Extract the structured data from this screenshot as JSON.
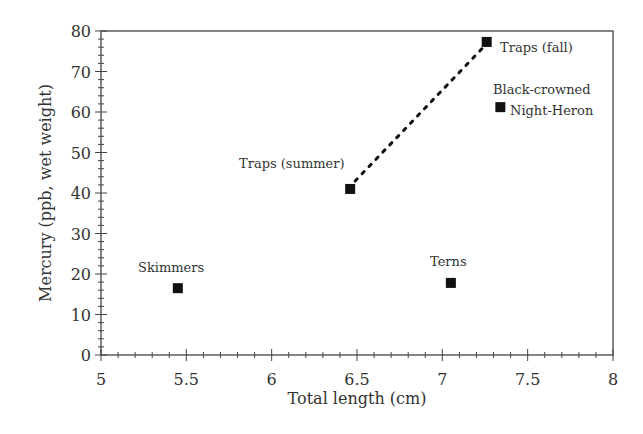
{
  "chart_data": {
    "type": "scatter",
    "title": "",
    "xlabel": "Total length (cm)",
    "ylabel": "Mercury (ppb, wet weight)",
    "xlim": [
      5,
      8
    ],
    "ylim": [
      0,
      80
    ],
    "x_ticks": [
      "5",
      "5.5",
      "6",
      "6.5",
      "7",
      "7.5",
      "8"
    ],
    "y_ticks": [
      "0",
      "10",
      "20",
      "30",
      "40",
      "50",
      "60",
      "70",
      "80"
    ],
    "grid": false,
    "legend": "none",
    "points": [
      {
        "label": "Skimmers",
        "x": 5.45,
        "y": 16.5
      },
      {
        "label": "Traps (summer)",
        "x": 6.46,
        "y": 41
      },
      {
        "label": "Terns",
        "x": 7.05,
        "y": 17.8
      },
      {
        "label": "Traps (fall)",
        "x": 7.26,
        "y": 77.3
      },
      {
        "label": "Black-crowned Night-Heron",
        "x": 7.34,
        "y": 61.2
      }
    ],
    "dashed_line": {
      "from": "Traps (summer)",
      "to": "Traps (fall)"
    }
  },
  "labels": {
    "skimmers": "Skimmers",
    "traps_summer": "Traps (summer)",
    "terns": "Terns",
    "traps_fall": "Traps (fall)",
    "heron_line1": "Black-crowned",
    "heron_line2": "Night-Heron"
  }
}
